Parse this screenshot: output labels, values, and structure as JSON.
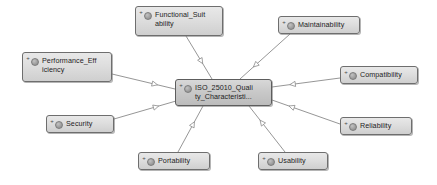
{
  "diagram": {
    "type": "uml-class-generalization",
    "background_color": "#ffffff",
    "node_fill_color": "#dedede",
    "node_border_color": "#6e6e6e",
    "edge_color": "#8a8a8a",
    "central": {
      "id": "iso-25010-quality-characteristics",
      "label": "ISO_25010_Quali ty_Characteristi...",
      "line1": "ISO_25010_Quali",
      "line2": "ty_Characteristi...",
      "x": 175,
      "y": 79,
      "width": 97,
      "height": 27,
      "icons": [
        "plus-icon",
        "class-circle-icon"
      ]
    },
    "nodes": [
      {
        "id": "functional-suitability",
        "label": "Functional_Suitability",
        "line1": "Functional_Suit",
        "line2": "ability",
        "x": 135,
        "y": 6,
        "width": 88,
        "height": 30,
        "icons": [
          "plus-icon",
          "class-circle-icon"
        ]
      },
      {
        "id": "maintainability",
        "label": "Maintainability",
        "line1": "Maintainability",
        "line2": "",
        "x": 278,
        "y": 16,
        "width": 82,
        "height": 18,
        "icons": [
          "plus-icon",
          "class-circle-icon"
        ]
      },
      {
        "id": "performance-efficiency",
        "label": "Performance_Efficiency",
        "line1": "Performance_Eff",
        "line2": "iciency",
        "x": 22,
        "y": 52,
        "width": 90,
        "height": 30,
        "icons": [
          "plus-icon",
          "class-circle-icon"
        ]
      },
      {
        "id": "compatibility",
        "label": "Compatibility",
        "line1": "Compatibility",
        "line2": "",
        "x": 340,
        "y": 66,
        "width": 78,
        "height": 18,
        "icons": [
          "plus-icon",
          "class-circle-icon"
        ]
      },
      {
        "id": "security",
        "label": "Security",
        "line1": "Security",
        "line2": "",
        "x": 46,
        "y": 115,
        "width": 68,
        "height": 18,
        "icons": [
          "plus-icon",
          "class-circle-icon"
        ]
      },
      {
        "id": "reliability",
        "label": "Reliability",
        "line1": "Reliability",
        "line2": "",
        "x": 340,
        "y": 117,
        "width": 72,
        "height": 18,
        "icons": [
          "plus-icon",
          "class-circle-icon"
        ]
      },
      {
        "id": "portability",
        "label": "Portability",
        "line1": "Portability",
        "line2": "",
        "x": 138,
        "y": 152,
        "width": 72,
        "height": 18,
        "icons": [
          "plus-icon",
          "class-circle-icon"
        ]
      },
      {
        "id": "usability",
        "label": "Usability",
        "line1": "Usability",
        "line2": "",
        "x": 258,
        "y": 152,
        "width": 70,
        "height": 18,
        "icons": [
          "plus-icon",
          "class-circle-icon"
        ]
      }
    ],
    "edges": [
      {
        "from": "functional-suitability",
        "to": "iso-25010-quality-characteristics",
        "arrow": "hollow-triangle",
        "x1": 186,
        "y1": 36,
        "x2": 212,
        "y2": 79
      },
      {
        "from": "maintainability",
        "to": "iso-25010-quality-characteristics",
        "arrow": "hollow-triangle",
        "x1": 290,
        "y1": 34,
        "x2": 240,
        "y2": 79
      },
      {
        "from": "performance-efficiency",
        "to": "iso-25010-quality-characteristics",
        "arrow": "hollow-triangle",
        "x1": 112,
        "y1": 74,
        "x2": 175,
        "y2": 89
      },
      {
        "from": "compatibility",
        "to": "iso-25010-quality-characteristics",
        "arrow": "hollow-triangle",
        "x1": 340,
        "y1": 78,
        "x2": 272,
        "y2": 87
      },
      {
        "from": "security",
        "to": "iso-25010-quality-characteristics",
        "arrow": "hollow-triangle",
        "x1": 114,
        "y1": 119,
        "x2": 176,
        "y2": 101
      },
      {
        "from": "reliability",
        "to": "iso-25010-quality-characteristics",
        "arrow": "hollow-triangle",
        "x1": 340,
        "y1": 124,
        "x2": 272,
        "y2": 100
      },
      {
        "from": "portability",
        "to": "iso-25010-quality-characteristics",
        "arrow": "hollow-triangle",
        "x1": 178,
        "y1": 152,
        "x2": 203,
        "y2": 106
      },
      {
        "from": "usability",
        "to": "iso-25010-quality-characteristics",
        "arrow": "hollow-triangle",
        "x1": 285,
        "y1": 152,
        "x2": 249,
        "y2": 106
      }
    ]
  }
}
